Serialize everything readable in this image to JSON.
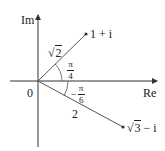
{
  "axes": {
    "x_label": "Re",
    "y_label": "Im",
    "origin_label": "0"
  },
  "points": [
    {
      "label": "1 + i",
      "modulus_label": "2",
      "modulus_sqrt": "√",
      "angle_num": "π",
      "angle_den": "4",
      "angle_sign": ""
    },
    {
      "label_sqrt": "√",
      "label_rad": "3",
      "label_rest": " − i",
      "modulus_label": "2",
      "angle_num": "π",
      "angle_den": "6",
      "angle_sign": "−"
    }
  ],
  "colors": {
    "line": "#333333",
    "text": "#222222",
    "background": "#ffffff"
  }
}
